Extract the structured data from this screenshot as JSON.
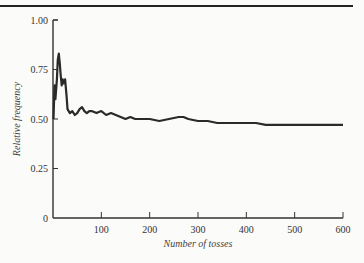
{
  "chart_data": {
    "type": "line",
    "title": "",
    "xlabel": "Number of tosses",
    "ylabel": "Relative frequency",
    "xlim": [
      0,
      600
    ],
    "ylim": [
      0,
      1.0
    ],
    "x_ticks": [
      "100",
      "200",
      "300",
      "400",
      "500",
      "600"
    ],
    "y_ticks": [
      "0",
      "0.25",
      "0.50",
      "0.75",
      "1.00"
    ],
    "grid": false,
    "legend": null,
    "series": [
      {
        "name": "Relative frequency of heads",
        "x": [
          1,
          3,
          5,
          8,
          10,
          12,
          14,
          16,
          18,
          20,
          22,
          25,
          28,
          30,
          35,
          40,
          45,
          50,
          55,
          60,
          65,
          70,
          75,
          80,
          90,
          100,
          110,
          120,
          130,
          140,
          150,
          160,
          170,
          180,
          190,
          200,
          220,
          240,
          260,
          270,
          280,
          300,
          320,
          340,
          360,
          380,
          400,
          420,
          440,
          460,
          480,
          500,
          520,
          540,
          560,
          580,
          600
        ],
        "values": [
          0.5,
          0.67,
          0.6,
          0.7,
          0.8,
          0.83,
          0.78,
          0.72,
          0.67,
          0.7,
          0.68,
          0.7,
          0.62,
          0.55,
          0.53,
          0.54,
          0.52,
          0.53,
          0.55,
          0.56,
          0.54,
          0.53,
          0.54,
          0.54,
          0.53,
          0.54,
          0.52,
          0.53,
          0.52,
          0.51,
          0.5,
          0.51,
          0.5,
          0.5,
          0.5,
          0.5,
          0.49,
          0.5,
          0.51,
          0.51,
          0.5,
          0.49,
          0.49,
          0.48,
          0.48,
          0.48,
          0.48,
          0.48,
          0.47,
          0.47,
          0.47,
          0.47,
          0.47,
          0.47,
          0.47,
          0.47,
          0.47
        ]
      }
    ]
  }
}
